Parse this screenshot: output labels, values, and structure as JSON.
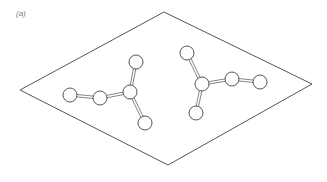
{
  "figure": {
    "panel_label": "(a)",
    "colors": {
      "stroke": "#555555",
      "bond": "#666666",
      "atom_fill": "#ffffff",
      "background": "#ffffff"
    },
    "cell": {
      "vertices": [
        [
          164,
          12
        ],
        [
          312,
          84
        ],
        [
          168,
          165
        ],
        [
          20,
          90
        ]
      ]
    },
    "molecules": [
      {
        "name": "left-molecule",
        "atoms": [
          [
            70,
            95
          ],
          [
            100,
            98
          ],
          [
            130,
            92
          ],
          [
            136,
            62
          ],
          [
            145,
            123
          ]
        ],
        "bonds": [
          [
            0,
            1
          ],
          [
            1,
            2
          ],
          [
            2,
            3
          ],
          [
            2,
            4
          ]
        ]
      },
      {
        "name": "right-molecule",
        "atoms": [
          [
            187,
            53
          ],
          [
            202,
            84
          ],
          [
            196,
            113
          ],
          [
            232,
            79
          ],
          [
            260,
            82
          ]
        ],
        "bonds": [
          [
            0,
            1
          ],
          [
            1,
            2
          ],
          [
            1,
            3
          ],
          [
            3,
            4
          ]
        ]
      }
    ],
    "atom_radius": 7
  }
}
